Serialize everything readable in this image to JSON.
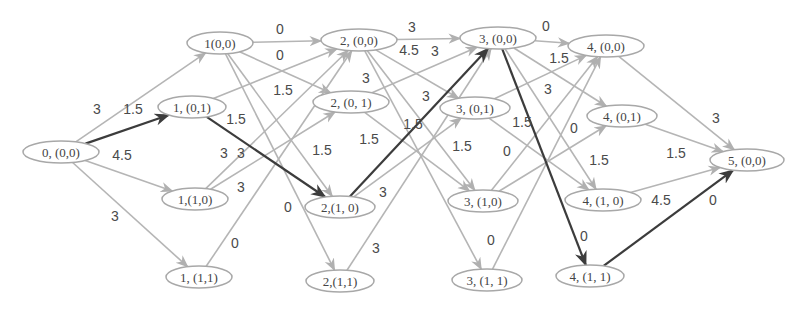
{
  "diagram": {
    "type": "layered-weighted-directed-graph",
    "colors": {
      "node_stroke": "#a8a8a8",
      "edge_light": "#b5b5b5",
      "edge_highlight": "#3c3c3c",
      "text": "#444444"
    },
    "nodes": [
      {
        "id": "n0_00",
        "label": "0, (0,0)",
        "x": 61,
        "y": 152,
        "rx": 38,
        "ry": 11
      },
      {
        "id": "n1_00",
        "label": "1(0,0)",
        "x": 220,
        "y": 43,
        "rx": 33,
        "ry": 11
      },
      {
        "id": "n1_01",
        "label": "1, (0,1)",
        "x": 192,
        "y": 107,
        "rx": 34,
        "ry": 11
      },
      {
        "id": "n1_10",
        "label": "1,(1,0)",
        "x": 195,
        "y": 199,
        "rx": 33,
        "ry": 11
      },
      {
        "id": "n1_11",
        "label": "1, (1,1)",
        "x": 199,
        "y": 277,
        "rx": 33,
        "ry": 11
      },
      {
        "id": "n2_00",
        "label": "2, (0,0)",
        "x": 359,
        "y": 40,
        "rx": 38,
        "ry": 11
      },
      {
        "id": "n2_01",
        "label": "2, (0, 1)",
        "x": 351,
        "y": 102,
        "rx": 38,
        "ry": 11
      },
      {
        "id": "n2_10",
        "label": "2,(1, 0)",
        "x": 340,
        "y": 207,
        "rx": 35,
        "ry": 11
      },
      {
        "id": "n2_11",
        "label": "2,(1,1)",
        "x": 340,
        "y": 281,
        "rx": 34,
        "ry": 11
      },
      {
        "id": "n3_00",
        "label": "3, (0,0)",
        "x": 498,
        "y": 38,
        "rx": 38,
        "ry": 11
      },
      {
        "id": "n3_01",
        "label": "3, (0,1)",
        "x": 475,
        "y": 108,
        "rx": 35,
        "ry": 11
      },
      {
        "id": "n3_10",
        "label": "3, (1,0)",
        "x": 483,
        "y": 201,
        "rx": 35,
        "ry": 11
      },
      {
        "id": "n3_11",
        "label": "3, (1, 1)",
        "x": 487,
        "y": 280,
        "rx": 35,
        "ry": 11
      },
      {
        "id": "n4_00",
        "label": "4, (0,0)",
        "x": 606,
        "y": 46,
        "rx": 38,
        "ry": 11
      },
      {
        "id": "n4_01",
        "label": "4, (0,1)",
        "x": 622,
        "y": 116,
        "rx": 35,
        "ry": 11
      },
      {
        "id": "n4_10",
        "label": "4, (1, 0)",
        "x": 603,
        "y": 200,
        "rx": 38,
        "ry": 11
      },
      {
        "id": "n4_11",
        "label": "4, (1, 1)",
        "x": 590,
        "y": 276,
        "rx": 34,
        "ry": 11
      },
      {
        "id": "n5_00",
        "label": "5, (0,0)",
        "x": 747,
        "y": 160,
        "rx": 37,
        "ry": 11
      }
    ],
    "edges": [
      {
        "from": "n0_00",
        "to": "n1_00",
        "highlight": false
      },
      {
        "from": "n0_00",
        "to": "n1_01",
        "highlight": true
      },
      {
        "from": "n0_00",
        "to": "n1_10",
        "highlight": false
      },
      {
        "from": "n0_00",
        "to": "n1_11",
        "highlight": false
      },
      {
        "from": "n1_00",
        "to": "n2_00",
        "highlight": false
      },
      {
        "from": "n1_00",
        "to": "n2_01",
        "highlight": false
      },
      {
        "from": "n1_00",
        "to": "n2_10",
        "highlight": false
      },
      {
        "from": "n1_00",
        "to": "n2_11",
        "highlight": false
      },
      {
        "from": "n1_01",
        "to": "n2_00",
        "highlight": false
      },
      {
        "from": "n1_01",
        "to": "n2_10",
        "highlight": true
      },
      {
        "from": "n1_10",
        "to": "n2_00",
        "highlight": false
      },
      {
        "from": "n1_10",
        "to": "n2_01",
        "highlight": false
      },
      {
        "from": "n1_11",
        "to": "n2_00",
        "highlight": false
      },
      {
        "from": "n2_00",
        "to": "n3_00",
        "highlight": false
      },
      {
        "from": "n2_00",
        "to": "n3_01",
        "highlight": false
      },
      {
        "from": "n2_00",
        "to": "n3_10",
        "highlight": false
      },
      {
        "from": "n2_00",
        "to": "n3_11",
        "highlight": false
      },
      {
        "from": "n2_01",
        "to": "n3_00",
        "highlight": false
      },
      {
        "from": "n2_01",
        "to": "n3_10",
        "highlight": false
      },
      {
        "from": "n2_10",
        "to": "n3_00",
        "highlight": true
      },
      {
        "from": "n2_10",
        "to": "n3_01",
        "highlight": false
      },
      {
        "from": "n2_11",
        "to": "n3_00",
        "highlight": false
      },
      {
        "from": "n3_00",
        "to": "n4_00",
        "highlight": false
      },
      {
        "from": "n3_00",
        "to": "n4_01",
        "highlight": false
      },
      {
        "from": "n3_00",
        "to": "n4_10",
        "highlight": false
      },
      {
        "from": "n3_00",
        "to": "n4_11",
        "highlight": true
      },
      {
        "from": "n3_01",
        "to": "n4_00",
        "highlight": false
      },
      {
        "from": "n3_01",
        "to": "n4_10",
        "highlight": false
      },
      {
        "from": "n3_10",
        "to": "n4_00",
        "highlight": false
      },
      {
        "from": "n3_10",
        "to": "n4_01",
        "highlight": false
      },
      {
        "from": "n3_11",
        "to": "n4_00",
        "highlight": false
      },
      {
        "from": "n4_00",
        "to": "n5_00",
        "highlight": false
      },
      {
        "from": "n4_01",
        "to": "n5_00",
        "highlight": false
      },
      {
        "from": "n4_10",
        "to": "n5_00",
        "highlight": false
      },
      {
        "from": "n4_11",
        "to": "n5_00",
        "highlight": true
      }
    ],
    "weight_labels": [
      {
        "text": "3",
        "x": 97,
        "y": 109
      },
      {
        "text": "1.5",
        "x": 133,
        "y": 109
      },
      {
        "text": "4.5",
        "x": 122,
        "y": 155
      },
      {
        "text": "3",
        "x": 115,
        "y": 216
      },
      {
        "text": "0",
        "x": 280,
        "y": 29
      },
      {
        "text": "0",
        "x": 280,
        "y": 55
      },
      {
        "text": "1.5",
        "x": 283,
        "y": 90
      },
      {
        "text": "1.5",
        "x": 236,
        "y": 119
      },
      {
        "text": "3",
        "x": 224,
        "y": 153
      },
      {
        "text": "1.5",
        "x": 322,
        "y": 150
      },
      {
        "text": "3",
        "x": 241,
        "y": 187
      },
      {
        "text": "3",
        "x": 241,
        "y": 153
      },
      {
        "text": "0",
        "x": 288,
        "y": 207
      },
      {
        "text": "0",
        "x": 235,
        "y": 243
      },
      {
        "text": "3",
        "x": 412,
        "y": 27
      },
      {
        "text": "4.5",
        "x": 409,
        "y": 50
      },
      {
        "text": "3",
        "x": 435,
        "y": 51
      },
      {
        "text": "3",
        "x": 366,
        "y": 78
      },
      {
        "text": "3",
        "x": 426,
        "y": 96
      },
      {
        "text": "1.5",
        "x": 369,
        "y": 139
      },
      {
        "text": "1.5",
        "x": 462,
        "y": 146
      },
      {
        "text": "3",
        "x": 383,
        "y": 192
      },
      {
        "text": "3",
        "x": 376,
        "y": 248
      },
      {
        "text": "1.5",
        "x": 413,
        "y": 124
      },
      {
        "text": "0",
        "x": 546,
        "y": 26
      },
      {
        "text": "1.5",
        "x": 559,
        "y": 58
      },
      {
        "text": "3",
        "x": 548,
        "y": 89
      },
      {
        "text": "1.5",
        "x": 522,
        "y": 122
      },
      {
        "text": "0",
        "x": 574,
        "y": 128
      },
      {
        "text": "0",
        "x": 507,
        "y": 151
      },
      {
        "text": "1.5",
        "x": 599,
        "y": 160
      },
      {
        "text": "0",
        "x": 491,
        "y": 240
      },
      {
        "text": "0",
        "x": 584,
        "y": 236
      },
      {
        "text": "3",
        "x": 716,
        "y": 118
      },
      {
        "text": "1.5",
        "x": 676,
        "y": 153
      },
      {
        "text": "4.5",
        "x": 661,
        "y": 200
      },
      {
        "text": "0",
        "x": 713,
        "y": 200
      }
    ]
  }
}
